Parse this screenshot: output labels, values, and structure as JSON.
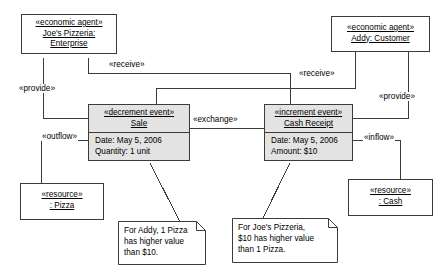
{
  "diagram": {
    "stroke_color": "#3b3b3b",
    "event_fill": "#e3e3e3",
    "resource_fill": "#ffffff"
  },
  "nodes": {
    "joes_pizzeria": {
      "stereotype": "«economic agent»",
      "name_line1": "Joe's Pizzeria:",
      "name_line2": "Enterprise"
    },
    "addy_customer": {
      "stereotype": "«economic agent»",
      "name_line1": "Addy: Customer"
    },
    "sale_event": {
      "stereotype": "«decrement event»",
      "name_line1": "Sale",
      "attr1": "Date: May 5, 2006",
      "attr2": "Quantity: 1 unit"
    },
    "cash_receipt_event": {
      "stereotype": "«increment event»",
      "name_line1": "Cash Receipt",
      "attr1": "Date: May 5, 2006",
      "attr2": "Amount: $10"
    },
    "pizza_resource": {
      "stereotype": "«resource»",
      "name_line1": ": Pizza"
    },
    "cash_resource": {
      "stereotype": "«resource»",
      "name_line1": ": Cash"
    }
  },
  "edge_labels": {
    "provide_left": "«provide»",
    "receive_left": "«receive»",
    "receive_right": "«receive»",
    "provide_right": "«provide»",
    "exchange": "«exchange»",
    "outflow": "«outflow»",
    "inflow": "«inflow»"
  },
  "notes": {
    "note_addy": {
      "line1": "For Addy, 1 Pizza",
      "line2": "has higher value",
      "line3": "than $10."
    },
    "note_joes": {
      "line1": "For Joe's Pizzeria,",
      "line2": "$10 has higher value",
      "line3": "than 1 Pizza."
    }
  }
}
